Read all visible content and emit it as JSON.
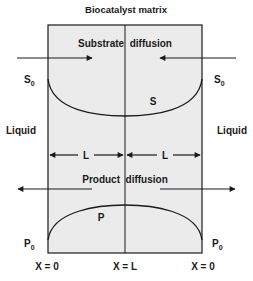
{
  "title": "Biocatalyst matrix",
  "colors": {
    "matrix_fill": "#ebebeb",
    "stroke": "#1a1a1a",
    "background": "#ffffff"
  },
  "labels": {
    "substrate_diffusion": "Substrate  diffusion",
    "product_diffusion": "Product  diffusion",
    "liquid_left": "Liquid",
    "liquid_right": "Liquid",
    "s0_left": "S",
    "s0_left_sub": "0",
    "s0_right": "S",
    "s0_right_sub": "0",
    "p0_left": "P",
    "p0_left_sub": "0",
    "p0_right": "P",
    "p0_right_sub": "0",
    "s_curve": "S",
    "p_curve": "P",
    "half_length_left": "L",
    "half_length_right": "L"
  },
  "x_axis": {
    "left": "X = 0",
    "center": "X = L",
    "right": "X = 0"
  }
}
